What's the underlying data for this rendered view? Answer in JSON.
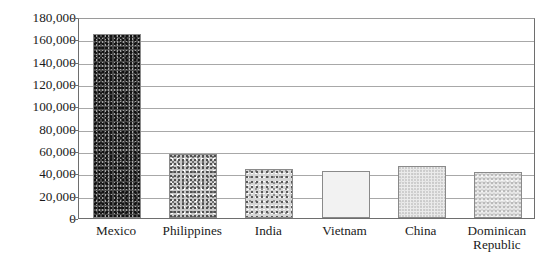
{
  "chart_data": {
    "type": "bar",
    "title": "",
    "xlabel": "",
    "ylabel": "",
    "categories": [
      "Mexico",
      "Philippines",
      "India",
      "Vietnam",
      "China",
      "Dominican Republic"
    ],
    "values": [
      165000,
      57000,
      44000,
      42000,
      47000,
      41000
    ],
    "ylim": [
      0,
      180000
    ],
    "ytick_labels": [
      "180,000",
      "160,000",
      "140,000",
      "120,000",
      "100,000",
      "80,000",
      "60,000",
      "40,000",
      "20,000",
      "0"
    ],
    "ytick_values": [
      180000,
      160000,
      140000,
      120000,
      100000,
      80000,
      60000,
      40000,
      20000,
      0
    ],
    "grid": true,
    "legend": "none",
    "bar_textures": [
      "dark-stipple",
      "medium-stipple",
      "medium-stipple",
      "coarse-squiggle",
      "light-stipple",
      "light-stipple"
    ],
    "colors": {
      "axis": "#6e6e6e",
      "gridline": "#a8a8a8",
      "text": "#1a1a1a",
      "background": "#ffffff"
    }
  },
  "x_label_lines": [
    [
      "Mexico"
    ],
    [
      "Philippines"
    ],
    [
      "India"
    ],
    [
      "Vietnam"
    ],
    [
      "China"
    ],
    [
      "Dominican",
      "Republic"
    ]
  ]
}
